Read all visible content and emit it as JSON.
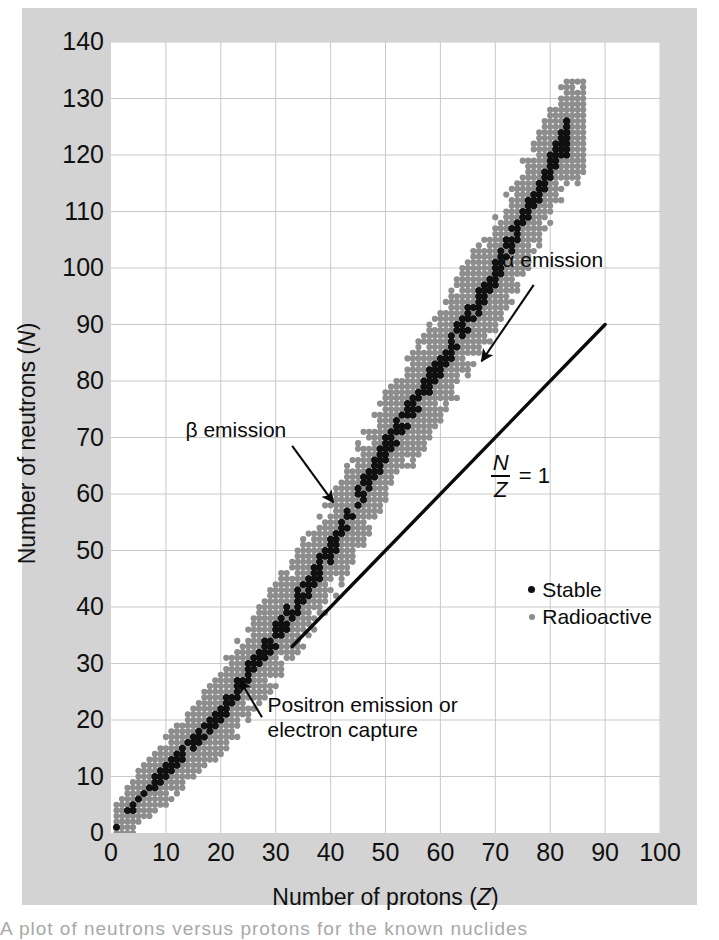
{
  "figure": {
    "background_color": "#d3d3d3",
    "plot_background_color": "#ffffff",
    "copyright": "© 2013 Cengage Learning",
    "caption_fragment": "A plot of neutrons versus protons for the known nuclides"
  },
  "chart_data": {
    "type": "scatter",
    "title": "",
    "xlabel": "Number of protons (Z)",
    "ylabel": "Number of neutrons (N)",
    "xlim": [
      0,
      100
    ],
    "ylim": [
      0,
      140
    ],
    "xticks": [
      0,
      10,
      20,
      30,
      40,
      50,
      60,
      70,
      80,
      90,
      100
    ],
    "yticks": [
      0,
      10,
      20,
      30,
      40,
      50,
      60,
      70,
      80,
      90,
      100,
      110,
      120,
      130,
      140
    ],
    "xtick_step": 10,
    "ytick_step": 10,
    "grid": true,
    "grid_color": "#c9c9c9",
    "axis_color": "#101010",
    "legend_position": "inside-right",
    "series": [
      {
        "name": "Stable",
        "marker": "dot",
        "color": "#101010",
        "size": 5.2,
        "description": "Dark dots forming the narrow valley of stability running from the origin up to about Z=83."
      },
      {
        "name": "Radioactive",
        "marker": "dot",
        "color": "#8d8d8d",
        "size": 4.6,
        "description": "Grey dots forming the broad belt of known unstable nuclides surrounding the stable valley."
      }
    ],
    "reference_line": {
      "label": "N/Z = 1",
      "label_numerator": "N",
      "label_denominator": "Z",
      "label_suffix": "= 1",
      "equation": "N = Z",
      "from": [
        33,
        33
      ],
      "to": [
        90,
        90
      ],
      "color": "#0a0a0a",
      "width": 3.4
    },
    "band": {
      "description": "Valley of stability; N/Z ratio rises from 1 at low Z to about 1.5 at high Z.",
      "z_min": 1,
      "z_max": 83,
      "z_max_known": 86,
      "n_at_zmax": 126,
      "knots": [
        {
          "z": 1,
          "n_center": 1,
          "half_width": 1
        },
        {
          "z": 5,
          "n_center": 6,
          "half_width": 2
        },
        {
          "z": 10,
          "n_center": 11,
          "half_width": 3
        },
        {
          "z": 20,
          "n_center": 21,
          "half_width": 4
        },
        {
          "z": 26,
          "n_center": 30,
          "half_width": 4
        },
        {
          "z": 30,
          "n_center": 35,
          "half_width": 5
        },
        {
          "z": 40,
          "n_center": 50,
          "half_width": 5
        },
        {
          "z": 50,
          "n_center": 68,
          "half_width": 6
        },
        {
          "z": 60,
          "n_center": 83,
          "half_width": 6
        },
        {
          "z": 70,
          "n_center": 99,
          "half_width": 6
        },
        {
          "z": 80,
          "n_center": 118,
          "half_width": 6
        },
        {
          "z": 83,
          "n_center": 124,
          "half_width": 5
        }
      ]
    },
    "annotations": [
      {
        "name": "alpha-emission",
        "text": "α emission",
        "text_xy": [
          72,
          101
        ],
        "arrow_from": [
          77,
          97
        ],
        "arrow_to": [
          67.5,
          83.5
        ]
      },
      {
        "name": "beta-emission",
        "text": "β emission",
        "text_xy": [
          24.5,
          71
        ],
        "arrow_from": [
          33,
          68.5
        ],
        "arrow_to": [
          40.5,
          58.5
        ]
      },
      {
        "name": "positron-emission-electron-capture",
        "text_line1": "Positron emission or",
        "text_line2": "electron capture",
        "text_xy": [
          28.5,
          22.5
        ],
        "arrow_from": [
          27.5,
          20.5
        ],
        "arrow_to": [
          23.5,
          27
        ]
      }
    ],
    "legend": [
      {
        "label": "Stable",
        "marker_color": "#101010"
      },
      {
        "label": "Radioactive",
        "marker_color": "#8d8d8d"
      }
    ],
    "legend_xy": [
      76,
      43
    ]
  }
}
